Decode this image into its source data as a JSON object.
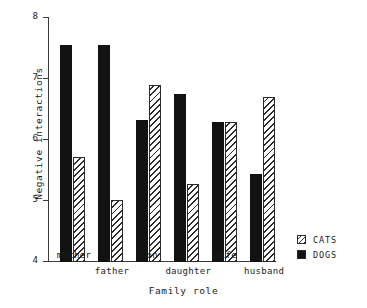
{
  "chart_data": {
    "type": "bar",
    "title": "",
    "xlabel": "Family role",
    "ylabel": "Negative interactions",
    "categories": [
      "mother",
      "father",
      "son",
      "daughter",
      "wife",
      "husband"
    ],
    "series": [
      {
        "name": "DOGS",
        "values": [
          7.55,
          7.55,
          6.33,
          6.76,
          6.3,
          5.45
        ]
      },
      {
        "name": "CATS",
        "values": [
          5.72,
          5.02,
          6.9,
          5.28,
          6.3,
          6.7
        ]
      }
    ],
    "ylim": [
      4,
      8
    ],
    "yticks": [
      4,
      5,
      6,
      7,
      8
    ],
    "ytick_labels": [
      "4",
      "5",
      "6",
      "7",
      "8"
    ],
    "grid": false,
    "legend_position": "right-bottom",
    "legend": [
      {
        "label": "CATS",
        "swatch": "hatched"
      },
      {
        "label": "DOGS",
        "swatch": "solid-black"
      }
    ],
    "colors": {
      "dogs": "#121212",
      "cats_outline": "#2b2b2b",
      "cats_fill": "#ffffff",
      "axis": "#3a3a3a",
      "text": "#1a1a1a",
      "background": "#ffffff"
    }
  }
}
